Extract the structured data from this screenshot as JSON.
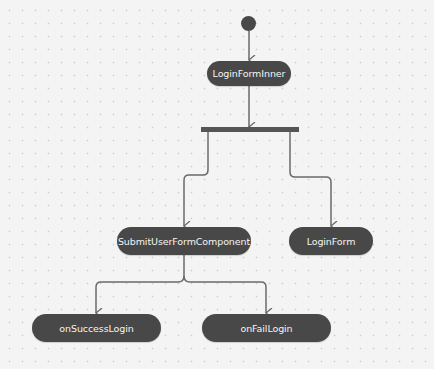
{
  "diagram": {
    "type": "activity",
    "colors": {
      "node_fill": "#484848",
      "node_text": "#f4f4f4",
      "edge": "#6a6a6a",
      "background": "#f4f4f4"
    },
    "start": {
      "x": 241,
      "y": 12
    },
    "fork": {
      "x": 201,
      "y": 127,
      "width": 98
    },
    "nodes": [
      {
        "id": "loginFormInner",
        "label": "LoginFormInner",
        "x": 207,
        "y": 116
      },
      {
        "id": "submitUserFormComponent",
        "label": "SubmitUserFormComponent",
        "x": 117,
        "y": 227
      },
      {
        "id": "loginForm",
        "label": "LoginForm",
        "x": 289,
        "y": 227
      },
      {
        "id": "onSuccessLogin",
        "label": "onSuccessLogin",
        "x": 32,
        "y": 314
      },
      {
        "id": "onFailLogin",
        "label": "onFailLogin",
        "x": 202,
        "y": 314
      }
    ],
    "edges": [
      {
        "from": "start",
        "to": "loginFormInner"
      },
      {
        "from": "loginFormInner",
        "to": "fork"
      },
      {
        "from": "fork",
        "to": "submitUserFormComponent"
      },
      {
        "from": "fork",
        "to": "loginForm"
      },
      {
        "from": "submitUserFormComponent",
        "to": "onSuccessLogin"
      },
      {
        "from": "submitUserFormComponent",
        "to": "onFailLogin"
      }
    ]
  }
}
